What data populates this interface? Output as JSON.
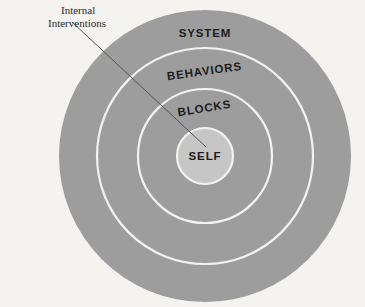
{
  "figure": {
    "type": "concentric-circles-diagram",
    "background_color": "#f4f3ef",
    "band_color": "#9d9d9d",
    "core_color": "#c6c6c6",
    "separator_color": "#f2f2ee",
    "label_color": "#1c1c1c",
    "leader_line_color": "#555555",
    "center": {
      "x": 205,
      "y": 156
    },
    "radii": {
      "system": 146,
      "behaviors": 108,
      "blocks": 67,
      "self": 28
    }
  },
  "rings": [
    {
      "key": "system",
      "label": "SYSTEM",
      "outer_radius": 146,
      "label_x": 205,
      "label_y": 37,
      "rotation": 0
    },
    {
      "key": "behaviors",
      "label": "BEHAVIORS",
      "outer_radius": 108,
      "label_x": 205,
      "label_y": 75,
      "rotation": -8
    },
    {
      "key": "blocks",
      "label": "BLOCKS",
      "outer_radius": 67,
      "label_x": 205,
      "label_y": 112,
      "rotation": -9
    },
    {
      "key": "self",
      "label": "SELF",
      "outer_radius": 28,
      "label_x": 205,
      "label_y": 160,
      "rotation": 0
    }
  ],
  "annotation": {
    "name": "internal-interventions",
    "line1": "Internal",
    "line2": "Interventions",
    "line1_x": 61,
    "line1_y": 14,
    "line2_x": 48,
    "line2_y": 27,
    "leader": {
      "x1": 72,
      "y1": 22,
      "x2": 206,
      "y2": 147
    }
  }
}
